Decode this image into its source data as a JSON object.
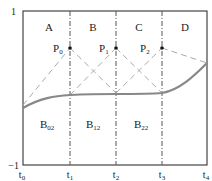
{
  "diagram": {
    "y_axis": {
      "top_label": "1",
      "bottom_label": "−1"
    },
    "knots": [
      {
        "base": "t",
        "sub": "0"
      },
      {
        "base": "t",
        "sub": "1"
      },
      {
        "base": "t",
        "sub": "2"
      },
      {
        "base": "t",
        "sub": "3"
      },
      {
        "base": "t",
        "sub": "4"
      }
    ],
    "regions": [
      "A",
      "B",
      "C",
      "D"
    ],
    "control_points": [
      {
        "base": "P",
        "sub": "0"
      },
      {
        "base": "P",
        "sub": "1"
      },
      {
        "base": "P",
        "sub": "2"
      }
    ],
    "basis_labels": [
      {
        "base": "B",
        "sub": "02"
      },
      {
        "base": "B",
        "sub": "12"
      },
      {
        "base": "B",
        "sub": "22"
      }
    ],
    "colors": {
      "frame": "#444444",
      "curve": "#888888",
      "dashed": "#aaaaaa",
      "knot_line": "#555555",
      "point": "#111111"
    }
  }
}
